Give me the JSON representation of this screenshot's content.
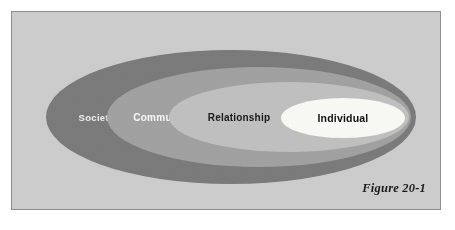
{
  "figure": {
    "caption": "Figure 20-1",
    "panel_background": "#cfcfcf",
    "panel_border": "#8e8e8e",
    "type": "nested-ellipse-ecological-model"
  },
  "rings": [
    {
      "id": "societal",
      "label": "Societal",
      "fill": "#7b7b7b",
      "text_color": "#f2f2f2",
      "level": 1,
      "cx": 219,
      "cy": 105,
      "rx": 185,
      "ry": 67
    },
    {
      "id": "community",
      "label": "Community",
      "fill": "#a3a3a3",
      "text_color": "#fbfbfb",
      "level": 2,
      "cx": 247,
      "cy": 105,
      "rx": 152,
      "ry": 50
    },
    {
      "id": "relationship",
      "label": "Relationship",
      "fill": "#c2c2c2",
      "text_color": "#191919",
      "level": 3,
      "cx": 277,
      "cy": 105,
      "rx": 120,
      "ry": 35
    },
    {
      "id": "individual",
      "label": "Individual",
      "fill": "#fbfbf7",
      "text_color": "#111111",
      "level": 4,
      "cx": 331,
      "cy": 106,
      "rx": 62,
      "ry": 20
    }
  ]
}
